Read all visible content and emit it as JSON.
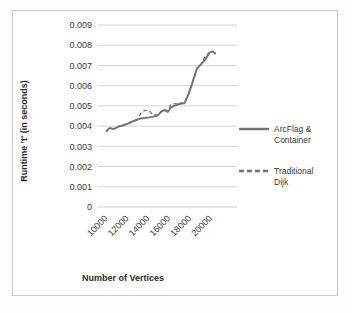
{
  "chart_data": {
    "type": "line",
    "title": "",
    "xlabel": "Number of Vertices",
    "ylabel": "Runtime 't' (in seconds)",
    "xlim": [
      9000,
      21000
    ],
    "ylim": [
      0,
      0.009
    ],
    "grid": true,
    "grid_axis": "y",
    "legend_position": "right",
    "x_ticks": [
      "10000",
      "12000",
      "14000",
      "16000",
      "18000",
      "20000"
    ],
    "x_tick_values": [
      10000,
      12000,
      14000,
      16000,
      18000,
      20000
    ],
    "y_ticks": [
      "0",
      "0.001",
      "0.002",
      "0.003",
      "0.004",
      "0.005",
      "0.006",
      "0.007",
      "0.008",
      "0.009"
    ],
    "y_tick_values": [
      0,
      0.001,
      0.002,
      0.003,
      0.004,
      0.005,
      0.006,
      0.007,
      0.008,
      0.009
    ],
    "x": [
      9800,
      10100,
      10500,
      11000,
      11500,
      12000,
      12400,
      12800,
      13100,
      13500,
      13900,
      14300,
      14700,
      15100,
      15400,
      15700,
      16000,
      16300,
      16700,
      17000,
      17300,
      17700,
      18100,
      18500,
      18900,
      19300,
      19700,
      20000,
      20300
    ],
    "series": [
      {
        "name": "ArcFlag & Container",
        "style": "solid",
        "color": "#737373",
        "values": [
          0.00375,
          0.0039,
          0.00385,
          0.00398,
          0.00405,
          0.00415,
          0.00425,
          0.00432,
          0.00438,
          0.0044,
          0.00443,
          0.00447,
          0.00452,
          0.00472,
          0.0048,
          0.0047,
          0.00492,
          0.005,
          0.00508,
          0.00512,
          0.00513,
          0.0056,
          0.0062,
          0.00685,
          0.00705,
          0.0073,
          0.00762,
          0.0077,
          0.00757
        ]
      },
      {
        "name": "Traditional Dijk",
        "style": "dashed",
        "color": "#737373",
        "values": [
          0.0037,
          0.00392,
          0.00388,
          0.004,
          0.00407,
          0.00417,
          0.00427,
          0.00434,
          0.00462,
          0.00478,
          0.00477,
          0.00455,
          0.00455,
          0.00475,
          0.00483,
          0.00473,
          0.00505,
          0.0051,
          0.00512,
          0.00514,
          0.00515,
          0.00562,
          0.00622,
          0.00687,
          0.00707,
          0.00745,
          0.00765,
          0.00768,
          0.00759
        ]
      }
    ]
  },
  "legend": {
    "items": [
      {
        "label_line1": "ArcFlag &",
        "label_line2": "Container",
        "style": "solid"
      },
      {
        "label_line1": "Traditional",
        "label_line2": "Dijk",
        "style": "dashed"
      }
    ]
  }
}
